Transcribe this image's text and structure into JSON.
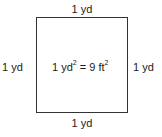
{
  "diagram": {
    "shape": "square",
    "labels": {
      "top": "1 yd",
      "bottom": "1 yd",
      "left": "1 yd",
      "right": "1 yd"
    },
    "center_equation": {
      "lhs_value": "1 yd",
      "lhs_exponent": "2",
      "equals": " = ",
      "rhs_value": "9 ft",
      "rhs_exponent": "2"
    }
  }
}
